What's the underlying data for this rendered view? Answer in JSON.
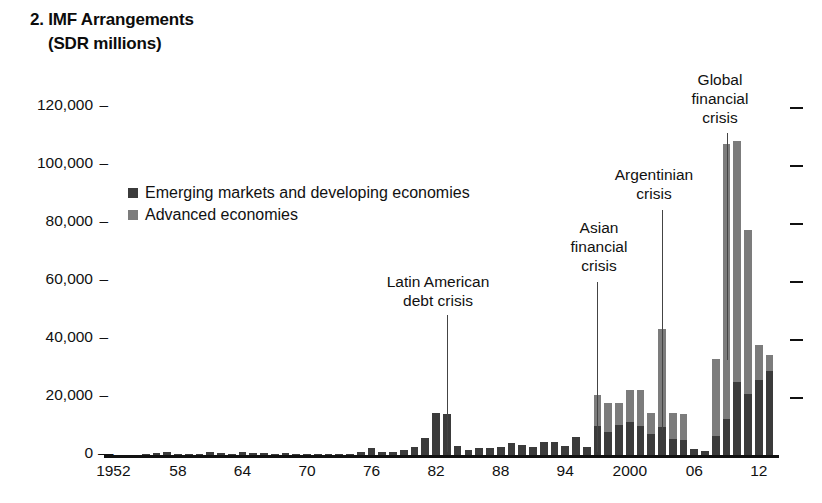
{
  "title": {
    "line1": "2. IMF Arrangements",
    "line2": "(SDR millions)"
  },
  "legend": {
    "position": "inside-top-left",
    "items": [
      {
        "label": "Emerging markets and developing economies",
        "color": "#3b3b3b",
        "key": "eme"
      },
      {
        "label": "Advanced economies",
        "color": "#7c7c7c",
        "key": "adv"
      }
    ]
  },
  "axes": {
    "y": {
      "label": "",
      "ticks": [
        "0",
        "20,000",
        "40,000",
        "60,000",
        "80,000",
        "100,000",
        "120,000"
      ],
      "tick_values": [
        0,
        20000,
        40000,
        60000,
        80000,
        100000,
        120000
      ],
      "min": 0,
      "max": 125000,
      "right_ticks": true
    },
    "x": {
      "label": "",
      "ticks": [
        "1952",
        "58",
        "64",
        "70",
        "76",
        "82",
        "88",
        "94",
        "2000",
        "06",
        "12"
      ],
      "tick_years": [
        1952,
        1958,
        1964,
        1970,
        1976,
        1982,
        1988,
        1994,
        2000,
        2006,
        2012
      ],
      "min": 1952,
      "max": 2013
    }
  },
  "annotations": [
    {
      "name": "latin-american-debt-crisis",
      "lines": [
        "Latin American",
        "debt crisis"
      ],
      "target_year": 1983
    },
    {
      "name": "asian-financial-crisis",
      "lines": [
        "Asian",
        "financial",
        "crisis"
      ],
      "target_year": 1997
    },
    {
      "name": "argentinian-crisis",
      "lines": [
        "Argentinian",
        "crisis"
      ],
      "target_year": 2003
    },
    {
      "name": "global-financial-crisis",
      "lines": [
        "Global",
        "financial",
        "crisis"
      ],
      "target_year": 2009
    }
  ],
  "chart_data": {
    "type": "bar",
    "title": "2. IMF Arrangements (SDR millions)",
    "subtitle": "",
    "xlabel": "",
    "ylabel": "SDR millions",
    "ylim": [
      0,
      125000
    ],
    "xlim": [
      1952,
      2013
    ],
    "grid": false,
    "stacked": true,
    "legend_position": "inside-top-left",
    "categories": [
      1952,
      1953,
      1954,
      1955,
      1956,
      1957,
      1958,
      1959,
      1960,
      1961,
      1962,
      1963,
      1964,
      1965,
      1966,
      1967,
      1968,
      1969,
      1970,
      1971,
      1972,
      1973,
      1974,
      1975,
      1976,
      1977,
      1978,
      1979,
      1980,
      1981,
      1982,
      1983,
      1984,
      1985,
      1986,
      1987,
      1988,
      1989,
      1990,
      1991,
      1992,
      1993,
      1994,
      1995,
      1996,
      1997,
      1998,
      1999,
      2000,
      2001,
      2002,
      2003,
      2004,
      2005,
      2006,
      2007,
      2008,
      2009,
      2010,
      2011,
      2012,
      2013
    ],
    "series": [
      {
        "name": "Emerging markets and developing economies",
        "color": "#3b3b3b",
        "values": [
          0,
          0,
          0,
          300,
          600,
          1100,
          400,
          500,
          400,
          900,
          600,
          500,
          900,
          800,
          700,
          500,
          700,
          500,
          300,
          300,
          200,
          400,
          300,
          1200,
          2400,
          900,
          1000,
          1700,
          2600,
          5800,
          14600,
          14200,
          3000,
          1800,
          2500,
          2500,
          2700,
          4200,
          3300,
          2900,
          4500,
          4500,
          3000,
          6200,
          2700,
          10000,
          8000,
          10500,
          11500,
          10000,
          7200,
          9500,
          5600,
          5000,
          2000,
          1500,
          6500,
          12500,
          25000,
          21000,
          26000,
          29000
        ]
      },
      {
        "name": "Advanced economies",
        "color": "#7c7c7c",
        "values": [
          0,
          0,
          0,
          0,
          0,
          0,
          0,
          0,
          0,
          0,
          0,
          0,
          0,
          0,
          0,
          0,
          0,
          0,
          0,
          0,
          0,
          0,
          0,
          0,
          0,
          0,
          0,
          0,
          0,
          0,
          0,
          0,
          0,
          0,
          0,
          0,
          0,
          0,
          0,
          0,
          0,
          0,
          0,
          0,
          0,
          10500,
          10000,
          7500,
          11000,
          12500,
          7200,
          34000,
          9000,
          9000,
          0,
          0,
          26500,
          94500,
          83000,
          56500,
          12000,
          5500
        ]
      }
    ],
    "totals": [
      0,
      0,
      0,
      300,
      600,
      1100,
      400,
      500,
      400,
      900,
      600,
      500,
      900,
      800,
      700,
      500,
      700,
      500,
      300,
      300,
      200,
      400,
      300,
      1200,
      2400,
      900,
      1000,
      1700,
      2600,
      5800,
      14600,
      14200,
      3000,
      1800,
      2500,
      2500,
      2700,
      4200,
      3300,
      2900,
      4500,
      4500,
      3000,
      6200,
      2700,
      20500,
      18000,
      18000,
      22500,
      22500,
      14400,
      43500,
      14600,
      14000,
      2000,
      1500,
      33000,
      107000,
      108000,
      77500,
      38000,
      34500
    ]
  }
}
